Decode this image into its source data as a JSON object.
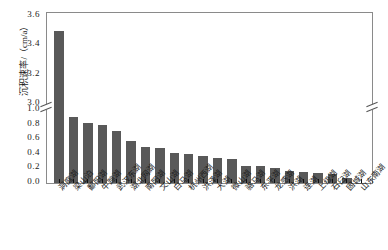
{
  "chart_data": {
    "type": "bar",
    "title": "",
    "subtitle": "",
    "xlabel": "",
    "ylabel": "沉积速率/（cm/a）",
    "ylim": [
      0.0,
      3.6
    ],
    "y_broken_axis": true,
    "y_break_lower_segment": [
      0.0,
      1.0
    ],
    "y_break_upper_segment": [
      3.0,
      3.6
    ],
    "y_ticks": [
      "3.6",
      "3.4",
      "3.2",
      "3.0",
      "1.0",
      "0.8",
      "0.6",
      "0.4",
      "0.2",
      "0.0"
    ],
    "y_tick_values": [
      3.6,
      3.4,
      3.2,
      3.0,
      1.0,
      0.8,
      0.6,
      0.4,
      0.2,
      0.0
    ],
    "grid": false,
    "legend": null,
    "bar_color": "#595959",
    "frame_color": "#8a8a8a",
    "categories": [
      "洞庭湖",
      "梁山泊",
      "鄱阳湖",
      "牛蹄湖",
      "武汉东湖",
      "湖北网湖",
      "南阳湖",
      "文山湖",
      "白马湖",
      "杭州西湖",
      "洪泽湖",
      "大湖",
      "微山湖",
      "骆马湖",
      "东平湖",
      "龙感湖",
      "洪湖",
      "连湖",
      "上级湖",
      "石臼湖",
      "固城湖",
      "山东南湖"
    ],
    "values": [
      3.5,
      0.91,
      0.82,
      0.79,
      0.71,
      0.58,
      0.49,
      0.475,
      0.41,
      0.395,
      0.375,
      0.34,
      0.325,
      0.23,
      0.23,
      0.21,
      0.16,
      0.15,
      0.14,
      0.13,
      0.065,
      0.005
    ],
    "unit": "cm/a",
    "series": [
      {
        "name": "沉积速率",
        "values": [
          3.5,
          0.91,
          0.82,
          0.79,
          0.71,
          0.58,
          0.49,
          0.475,
          0.41,
          0.395,
          0.375,
          0.34,
          0.325,
          0.23,
          0.23,
          0.21,
          0.16,
          0.15,
          0.14,
          0.13,
          0.065,
          0.005
        ]
      }
    ]
  }
}
